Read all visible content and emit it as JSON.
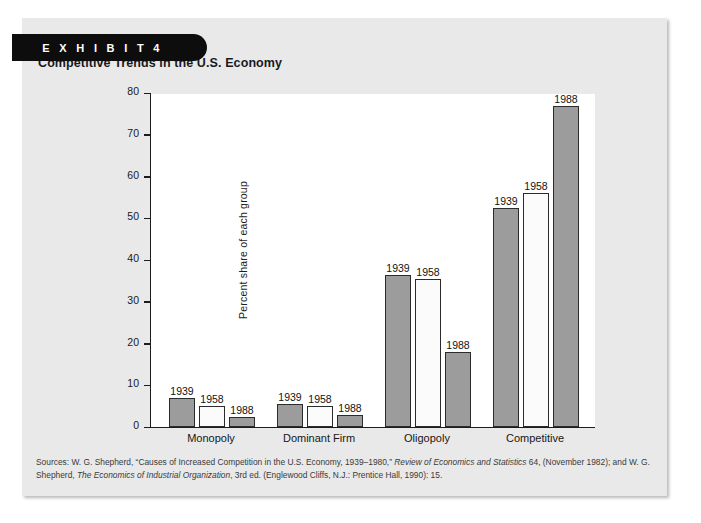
{
  "exhibit": {
    "tab_label": "E X H I B I T   4"
  },
  "card": {
    "title": "Competitive Trends in the U.S. Economy"
  },
  "source_note": {
    "prefix": "Sources: W. G. Shepherd, “Causes of Increased Competition in the U.S. Economy, 1939–1980,” ",
    "italic1": "Review of Economics and Statistics",
    "middle": " 64, (November 1982); and W. G. Shepherd, ",
    "italic2": "The Economics of Industrial Organization",
    "suffix": ", 3rd ed. (Englewood Cliffs, N.J.: Prentice Hall, 1990): 15."
  },
  "colors": {
    "card_background": "#e9e9e9",
    "tab_background": "#0d0d0d",
    "plot_background": "#ffffff",
    "bar_gray": "#9c9c9c",
    "bar_white": "#fbfbfb",
    "bar_border": "#2b2b2b",
    "axis": "#1c1c1c"
  },
  "chart_data": {
    "type": "bar",
    "title": "Competitive Trends in the U.S. Economy",
    "xlabel": "",
    "ylabel": "Percent share of each group",
    "ylim": [
      0,
      80
    ],
    "yticks": [
      0,
      10,
      20,
      30,
      40,
      50,
      60,
      70,
      80
    ],
    "ytick_labels": [
      "0",
      "10",
      "20",
      "30",
      "40",
      "50",
      "60",
      "70",
      "80"
    ],
    "grid": false,
    "legend": "none",
    "bar_labels_shown": true,
    "categories": [
      "Monopoly",
      "Dominant Firm",
      "Oligopoly",
      "Competitive"
    ],
    "series": [
      {
        "name": "1939",
        "fill": "gray",
        "values": [
          7,
          5.5,
          36.5,
          52.5
        ]
      },
      {
        "name": "1958",
        "fill": "white",
        "values": [
          5,
          5,
          35.5,
          56
        ]
      },
      {
        "name": "1988",
        "fill": "gray",
        "values": [
          2.5,
          2.8,
          18,
          77
        ]
      }
    ]
  }
}
